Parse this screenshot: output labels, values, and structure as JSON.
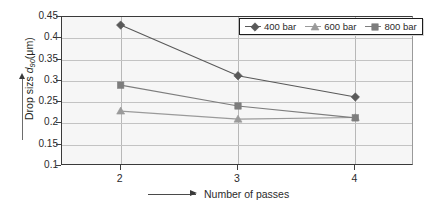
{
  "chart_data": {
    "type": "line",
    "title": "",
    "xlabel": "Number of passes",
    "ylabel": "Drop sizs d90(μm)",
    "ylabel_prefix": "Drop sizs ",
    "ylabel_var": "d",
    "ylabel_sub": "90",
    "ylabel_unit": "(μm)",
    "x": [
      2,
      3,
      4
    ],
    "xticklabels": [
      "2",
      "3",
      "4"
    ],
    "xlim": [
      1.5,
      4.5
    ],
    "ylim": [
      0.1,
      0.45
    ],
    "yticks": [
      0.45,
      0.4,
      0.35,
      0.3,
      0.25,
      0.2,
      0.15,
      0.1
    ],
    "yticklabels": [
      "0.45",
      "0.4",
      "0.35",
      "0.3",
      "0.25",
      "0.2",
      "0.15",
      "0.1"
    ],
    "grid": "horizontal-and-category-verticals",
    "legend_position": "top-right-inside",
    "series": [
      {
        "name": "400 bar",
        "marker": "diamond",
        "color": "#595959",
        "values": [
          0.431,
          0.312,
          0.262
        ]
      },
      {
        "name": "600 bar",
        "marker": "triangle",
        "color": "#9a9a9a",
        "values": [
          0.229,
          0.21,
          0.214
        ]
      },
      {
        "name": "800 bar",
        "marker": "square",
        "color": "#7d7d7d",
        "values": [
          0.29,
          0.241,
          0.213
        ]
      }
    ]
  },
  "legend": {
    "items": [
      {
        "label": "400 bar",
        "marker": "diamond-icon",
        "color": "#595959"
      },
      {
        "label": "600 bar",
        "marker": "triangle-icon",
        "color": "#9a9a9a"
      },
      {
        "label": "800 bar",
        "marker": "square-icon",
        "color": "#7d7d7d"
      }
    ]
  },
  "axes": {
    "y_tick_labels": [
      "0.45",
      "0.4",
      "0.35",
      "0.3",
      "0.25",
      "0.2",
      "0.15",
      "0.1"
    ],
    "x_tick_labels": [
      "2",
      "3",
      "4"
    ],
    "x_axis_title": "Number of passes",
    "y_axis_title_prefix": "Drop sizs ",
    "y_axis_title_var": "d",
    "y_axis_title_sub": "90",
    "y_axis_title_unit": "(μm)"
  },
  "colors": {
    "plot_background": "#f6f6f6",
    "frame": "#3a3a3a",
    "gridline": "#c3c3c3",
    "series_400": "#595959",
    "series_600": "#9a9a9a",
    "series_800": "#7d7d7d"
  }
}
